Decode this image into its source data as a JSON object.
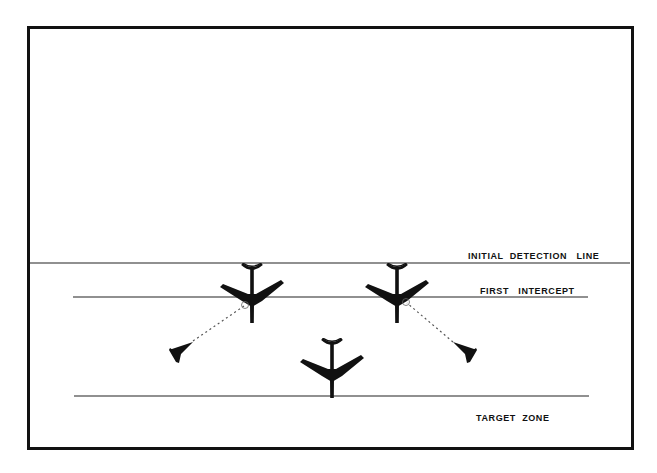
{
  "diagram": {
    "labels": {
      "initial_detection": "INITIAL  DETECTION   LINE",
      "first_intercept": "FIRST   INTERCEPT",
      "target_zone": "TARGET  ZONE"
    },
    "lines": [
      {
        "name": "initial-detection-line",
        "x1": 30,
        "x2": 630,
        "y": 263
      },
      {
        "name": "first-intercept-line",
        "x1": 73,
        "x2": 588,
        "y": 297
      },
      {
        "name": "target-zone-line",
        "x1": 74,
        "x2": 589,
        "y": 396
      }
    ],
    "bombers": [
      {
        "name": "bomber-left",
        "x": 252,
        "y": 263,
        "scale": 1
      },
      {
        "name": "bomber-right",
        "x": 397,
        "y": 263,
        "scale": 1
      },
      {
        "name": "bomber-center",
        "x": 332,
        "y": 338,
        "scale": 1
      }
    ],
    "interceptors": [
      {
        "name": "interceptor-left",
        "x": 181,
        "y": 350,
        "dir": "left"
      },
      {
        "name": "interceptor-right",
        "x": 465,
        "y": 350,
        "dir": "right"
      }
    ],
    "missile_paths": [
      {
        "name": "missile-path-left",
        "from": [
          193,
          341
        ],
        "to": [
          244,
          306
        ]
      },
      {
        "name": "missile-path-right",
        "from": [
          453,
          342
        ],
        "to": [
          407,
          303
        ]
      }
    ],
    "colors": {
      "ink": "#111111",
      "background": "#ffffff"
    }
  }
}
